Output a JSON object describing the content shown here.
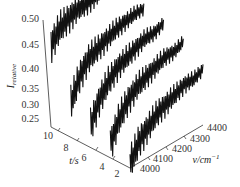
{
  "chart_data": {
    "type": "line",
    "subtype": "3d-waterfall",
    "title": "",
    "zlabel": "I_relative",
    "ylabel": "t/s",
    "xlabel": "ν/cm⁻¹",
    "z_ticks": [
      "0.50",
      "0.45",
      "0.40",
      "0.35",
      "0.30",
      "0.25"
    ],
    "zlim": [
      0.25,
      0.5
    ],
    "y_ticks": [
      "10",
      "8",
      "6",
      "4",
      "2"
    ],
    "ylim": [
      2,
      10
    ],
    "x_ticks": [
      "4000",
      "4100",
      "4200",
      "4300",
      "4400"
    ],
    "xlim": [
      4000,
      4400
    ],
    "grid": false,
    "legend": null,
    "series": [
      {
        "name": "t≈10 s",
        "t": 10,
        "x": [
          4000,
          4050,
          4100,
          4150,
          4200,
          4250,
          4300,
          4350,
          4400
        ],
        "values": [
          0.44,
          0.47,
          0.48,
          0.49,
          0.49,
          0.495,
          0.5,
          0.5,
          0.5
        ]
      },
      {
        "name": "t≈8 s",
        "t": 8,
        "x": [
          4000,
          4050,
          4100,
          4150,
          4200,
          4250,
          4300,
          4350,
          4400
        ],
        "values": [
          0.33,
          0.38,
          0.41,
          0.42,
          0.43,
          0.44,
          0.445,
          0.45,
          0.45
        ]
      },
      {
        "name": "t≈6 s",
        "t": 6,
        "x": [
          4000,
          4050,
          4100,
          4150,
          4200,
          4250,
          4300,
          4350,
          4400
        ],
        "values": [
          0.3,
          0.35,
          0.38,
          0.4,
          0.41,
          0.42,
          0.43,
          0.43,
          0.44
        ]
      },
      {
        "name": "t≈4 s",
        "t": 4,
        "x": [
          4000,
          4050,
          4100,
          4150,
          4200,
          4250,
          4300,
          4350,
          4400
        ],
        "values": [
          0.28,
          0.33,
          0.36,
          0.38,
          0.39,
          0.4,
          0.41,
          0.41,
          0.42
        ]
      },
      {
        "name": "t≈2 s",
        "t": 2,
        "x": [
          4000,
          4050,
          4100,
          4150,
          4200,
          4250,
          4300,
          4350,
          4400
        ],
        "values": [
          0.26,
          0.3,
          0.32,
          0.34,
          0.35,
          0.36,
          0.37,
          0.37,
          0.38
        ]
      }
    ]
  },
  "labels": {
    "z_axis": "I",
    "z_axis_sub": "relative",
    "t_axis": "t/s",
    "nu_axis": "ν/cm",
    "nu_axis_sup": "−1"
  }
}
